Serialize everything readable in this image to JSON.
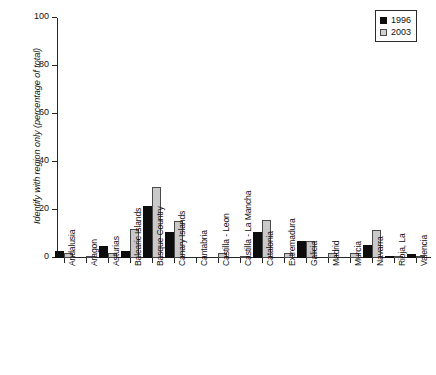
{
  "chart_data": {
    "type": "bar",
    "title": "",
    "xlabel": "",
    "ylabel": "Identify with region only (percentage of total)",
    "ylim": [
      0,
      100
    ],
    "yticks": [
      0,
      20,
      40,
      60,
      80,
      100
    ],
    "grid": false,
    "legend_position": "top-right",
    "categories": [
      "Andalusia",
      "Aragon",
      "Asturias",
      "Balearic Islands",
      "Basque Country",
      "Canary Islands",
      "Cantabria",
      "Castilla - Leon",
      "Castilla - La Mancha",
      "Catalonia",
      "Extremadura",
      "Galicia",
      "Madrid",
      "Murcia",
      "Navarra",
      "Rioja, La",
      "Valencia"
    ],
    "series": [
      {
        "name": "1996",
        "color": "#0d0d0d",
        "values": [
          3,
          0,
          5,
          3,
          21.5,
          11,
          0,
          0,
          0,
          11,
          0,
          7,
          0,
          0,
          5.5,
          1,
          1.5
        ]
      },
      {
        "name": "2003",
        "color": "#c9c9c9",
        "values": [
          2,
          1,
          2,
          12,
          29.5,
          15.5,
          0,
          2,
          1,
          16,
          2,
          7,
          2,
          2,
          11.5,
          0.7,
          0.7
        ]
      }
    ]
  },
  "legend": {
    "items": [
      {
        "label": "1996",
        "swatch": "filled-black-square"
      },
      {
        "label": "2003",
        "swatch": "light-gray-square"
      }
    ]
  },
  "axes": {
    "y_tick_labels": [
      "0",
      "20",
      "40",
      "60",
      "80",
      "100"
    ]
  }
}
